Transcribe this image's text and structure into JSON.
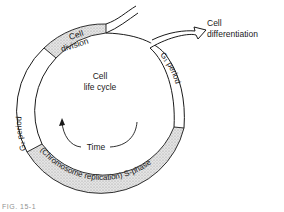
{
  "diagram": {
    "title": "Cell life cycle",
    "center_label_line1": "Cell",
    "center_label_line2": "life cycle",
    "time_label": "Time",
    "segments": [
      {
        "name": "cell-division",
        "label_line1": "Cell",
        "label_line2": "division",
        "shaded": true
      },
      {
        "name": "g1-period",
        "label": "G₁ period",
        "shaded": false
      },
      {
        "name": "s-phase",
        "label": "(Chromosome replication) S-phase",
        "shaded": true
      },
      {
        "name": "g2-period",
        "label": "G₂ period",
        "shaded": false
      }
    ],
    "branch_label_line1": "Cell",
    "branch_label_line2": "differentiation",
    "colors": {
      "line": "#1a1a1a",
      "stipple": "#cfcfcf",
      "background": "#ffffff"
    }
  },
  "caption": "FIG. 15-1"
}
